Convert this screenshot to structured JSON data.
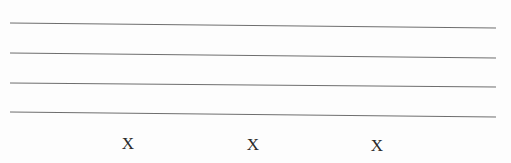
{
  "document": {
    "ruled_lines": [
      {
        "x1": 10,
        "y1": 23,
        "x2": 496,
        "y2": 28
      },
      {
        "x1": 10,
        "y1": 53,
        "x2": 496,
        "y2": 58
      },
      {
        "x1": 10,
        "y1": 83,
        "x2": 496,
        "y2": 87
      },
      {
        "x1": 10,
        "y1": 112,
        "x2": 496,
        "y2": 117
      }
    ],
    "line_color": "#6e6e6e",
    "marks": [
      {
        "label": "X",
        "x": 128,
        "y": 135
      },
      {
        "label": "X",
        "x": 253,
        "y": 136
      },
      {
        "label": "X",
        "x": 377,
        "y": 137
      }
    ]
  }
}
